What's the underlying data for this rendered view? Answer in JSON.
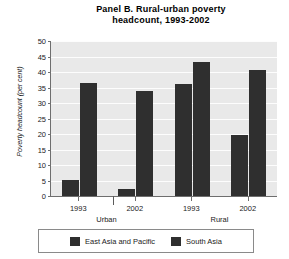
{
  "chart_data": {
    "type": "bar",
    "title": "Panel B. Rural-urban poverty headcount, 1993-2002",
    "title_line1": "Panel B. Rural-urban poverty",
    "title_line2": "headcount, 1993-2002",
    "xlabel": "",
    "ylabel": "Poverty headcount (per cent)",
    "ylim": [
      0,
      50
    ],
    "yticks": [
      0,
      5,
      10,
      15,
      20,
      25,
      30,
      35,
      40,
      45,
      50
    ],
    "ytick_labels": [
      "0",
      "5",
      "10",
      "15",
      "20",
      "25",
      "30",
      "35",
      "40",
      "45",
      "50"
    ],
    "grid": true,
    "legend_position": "bottom",
    "categories": [
      "1993",
      "2002",
      "1993",
      "2002"
    ],
    "group_labels": [
      "Urban",
      "Rural"
    ],
    "groups": [
      {
        "name": "Urban",
        "categories": [
          "1993",
          "2002"
        ]
      },
      {
        "name": "Rural",
        "categories": [
          "1993",
          "2002"
        ]
      }
    ],
    "series": [
      {
        "name": "East Asia and Pacific",
        "color": "#2f2f2f",
        "values": [
          5.3,
          2.2,
          36.0,
          19.8
        ]
      },
      {
        "name": "South Asia",
        "color": "#2f2f2f",
        "values": [
          36.5,
          34.0,
          43.2,
          40.5
        ]
      }
    ]
  },
  "legend": {
    "items": [
      {
        "label": "East Asia and Pacific",
        "color": "#2f2f2f"
      },
      {
        "label": "South Asia",
        "color": "#2f2f2f"
      }
    ]
  }
}
